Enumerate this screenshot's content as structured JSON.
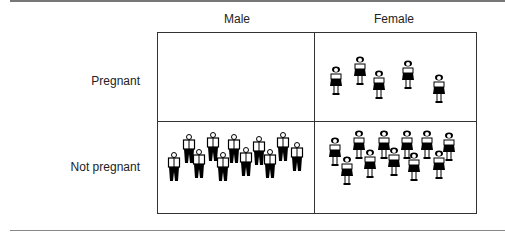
{
  "columns": [
    {
      "label": "Male"
    },
    {
      "label": "Female"
    }
  ],
  "rows": [
    {
      "label": "Pregnant"
    },
    {
      "label": "Not pregnant"
    }
  ],
  "cells": {
    "male_pregnant": {
      "count": 0,
      "icon": "man-icon"
    },
    "female_pregnant": {
      "count": 5,
      "icon": "woman-icon"
    },
    "male_not_pregnant": {
      "count": 11,
      "icon": "man-icon"
    },
    "female_not_pregnant": {
      "count": 11,
      "icon": "woman-icon"
    }
  }
}
